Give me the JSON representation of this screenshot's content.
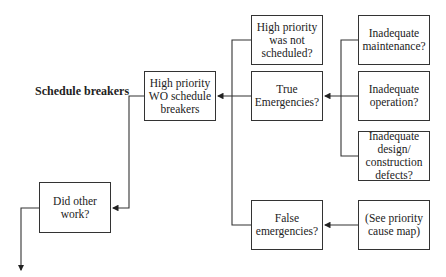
{
  "title": "Schedule breakers",
  "nodes": {
    "hp_wo": "High priority WO schedule breakers",
    "did_other": "Did other work?",
    "hp_not_sched": "High priority was not scheduled?",
    "true_emerg": "True Emergencies?",
    "false_emerg": "False emergencies?",
    "inad_maint": "Inadequate maintenance?",
    "inad_oper": "Inadequate operation?",
    "inad_design": "Inadequate design/ construction defects?",
    "see_priority": "(See priority cause map)"
  },
  "colors": {
    "line": "#333333",
    "background": "#ffffff"
  }
}
